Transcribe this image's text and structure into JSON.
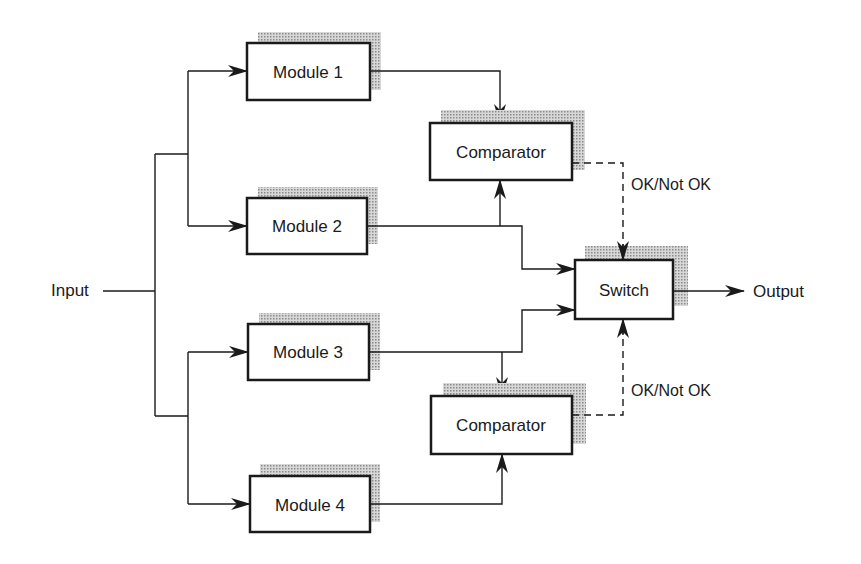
{
  "diagram": {
    "type": "block-diagram",
    "input_label": "Input",
    "output_label": "Output",
    "modules": [
      {
        "id": "module1",
        "label": "Module 1"
      },
      {
        "id": "module2",
        "label": "Module 2"
      },
      {
        "id": "module3",
        "label": "Module 3"
      },
      {
        "id": "module4",
        "label": "Module 4"
      }
    ],
    "comparators": [
      {
        "id": "comparator_top",
        "label": "Comparator",
        "inputs": [
          "module1",
          "module2"
        ]
      },
      {
        "id": "comparator_bottom",
        "label": "Comparator",
        "inputs": [
          "module3",
          "module4"
        ]
      }
    ],
    "switch": {
      "id": "switch",
      "label": "Switch",
      "inputs": [
        "module2",
        "module3"
      ]
    },
    "signals": [
      {
        "from": "comparator_top",
        "to": "switch",
        "label": "OK/Not OK",
        "style": "dashed"
      },
      {
        "from": "comparator_bottom",
        "to": "switch",
        "label": "OK/Not OK",
        "style": "dashed"
      }
    ],
    "colors": {
      "line": "#1a1a1a",
      "shadow": "#9a9a9a",
      "background": "#ffffff"
    }
  }
}
